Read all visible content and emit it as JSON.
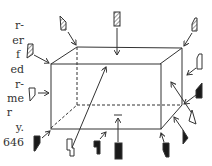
{
  "page_text_fragments": [
    {
      "text": "r-",
      "y": 20
    },
    {
      "text": "er",
      "y": 35
    },
    {
      "text": "f",
      "y": 49
    },
    {
      "text": "ed",
      "y": 64
    },
    {
      "text": "r-",
      "y": 79
    },
    {
      "text": "me",
      "y": 93
    },
    {
      "text": "r",
      "y": 107
    },
    {
      "text": "y.",
      "y": 122
    },
    {
      "text": "646",
      "y": 137
    }
  ],
  "diagram": {
    "colors": {
      "line": "#333333",
      "fill_dark": "#1a1a1a",
      "background": "#ffffff"
    },
    "box": {
      "front": {
        "tl": [
          51,
          64
        ],
        "tr": [
          160,
          64
        ],
        "br": [
          161,
          129
        ],
        "bl": [
          51,
          128
        ]
      },
      "back": {
        "tl": [
          77,
          47
        ],
        "tr": [
          182,
          48
        ],
        "br": [
          182,
          105
        ],
        "bl": [
          77,
          105
        ]
      },
      "hidden_edges": "dashed"
    },
    "figures": [
      {
        "type": "hatched-figure",
        "x": 60,
        "y": 15
      },
      {
        "type": "hatched-figure",
        "x": 115,
        "y": 12
      },
      {
        "type": "hatched-figure",
        "x": 193,
        "y": 18
      },
      {
        "type": "hatched-figure",
        "x": 27,
        "y": 45
      },
      {
        "type": "outline-figure",
        "x": 197,
        "y": 55
      },
      {
        "type": "outline-figure",
        "x": 30,
        "y": 92
      },
      {
        "type": "dark-figure",
        "x": 197,
        "y": 88
      },
      {
        "type": "outline-figure",
        "x": 193,
        "y": 113
      },
      {
        "type": "dark-figure",
        "x": 184,
        "y": 130
      },
      {
        "type": "dark-figure",
        "x": 33,
        "y": 138
      },
      {
        "type": "outline-figure",
        "x": 68,
        "y": 142
      },
      {
        "type": "dark-figure",
        "x": 95,
        "y": 142
      },
      {
        "type": "dark-figure",
        "x": 115,
        "y": 144
      },
      {
        "type": "dark-figure",
        "x": 164,
        "y": 144
      }
    ]
  }
}
